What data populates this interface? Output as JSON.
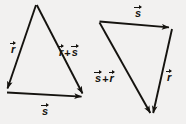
{
  "figure": {
    "background_color": "#f2f1f0",
    "stroke_color": "#15130f",
    "width": 186,
    "height": 124
  },
  "diagrams": [
    {
      "name": "left-triangle",
      "vertices": {
        "apex": [
          36,
          4
        ],
        "bottom_left": [
          6,
          92
        ],
        "bottom_right": [
          84,
          97
        ]
      },
      "arrows": [
        {
          "name": "vector-r",
          "from": [
            36,
            4
          ],
          "to": [
            6,
            92
          ]
        },
        {
          "name": "vector-r-plus-s",
          "from": [
            36,
            4
          ],
          "to": [
            84,
            97
          ]
        },
        {
          "name": "vector-s",
          "from": [
            6,
            92
          ],
          "to": [
            84,
            97
          ]
        }
      ],
      "labels": [
        {
          "name": "label-r",
          "text": "r",
          "operator": "",
          "text2": "",
          "x": 11,
          "y": 41
        },
        {
          "name": "label-r-plus-s",
          "text": "r",
          "operator": "+",
          "text2": "s",
          "x": 59,
          "y": 44
        },
        {
          "name": "label-s",
          "text": "s",
          "operator": "",
          "text2": "",
          "x": 42,
          "y": 103
        }
      ]
    },
    {
      "name": "right-triangle",
      "vertices": {
        "top_left": [
          99,
          21
        ],
        "top_right": [
          172,
          28
        ],
        "bottom": [
          152,
          117
        ]
      },
      "arrows": [
        {
          "name": "vector-s",
          "from": [
            99,
            21
          ],
          "to": [
            172,
            28
          ]
        },
        {
          "name": "vector-r",
          "from": [
            172,
            28
          ],
          "to": [
            152,
            117
          ]
        },
        {
          "name": "vector-s-plus-r",
          "from": [
            99,
            21
          ],
          "to": [
            152,
            117
          ]
        }
      ],
      "labels": [
        {
          "name": "label-s",
          "text": "s",
          "operator": "",
          "text2": "",
          "x": 135,
          "y": 5
        },
        {
          "name": "label-s-plus-r",
          "text": "s",
          "operator": "+",
          "text2": "r",
          "x": 95,
          "y": 70
        },
        {
          "name": "label-r",
          "text": "r",
          "operator": "",
          "text2": "",
          "x": 167,
          "y": 69
        }
      ]
    }
  ],
  "glyphs": {
    "r": "r",
    "s": "s",
    "plus": "+"
  }
}
